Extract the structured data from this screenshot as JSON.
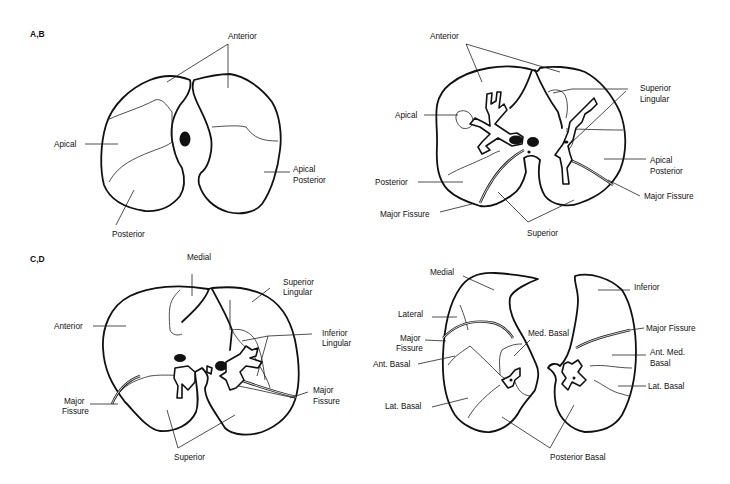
{
  "figure": {
    "panels": [
      {
        "id": "A,B",
        "left_section": {
          "labels": [
            "Anterior",
            "Apical",
            "Posterior",
            "Apical Posterior"
          ]
        },
        "right_section": {
          "labels": [
            "Anterior",
            "Apical",
            "Superior Lingular",
            "Apical Posterior",
            "Posterior",
            "Major Fissure",
            "Major Fissure",
            "Superior"
          ]
        }
      },
      {
        "id": "C,D",
        "left_section": {
          "labels": [
            "Medial",
            "Superior Lingular",
            "Anterior",
            "Inferior Lingular",
            "Major Fissure",
            "Major Fissure",
            "Superior"
          ]
        },
        "right_section": {
          "labels": [
            "Medial",
            "Inferior",
            "Lateral",
            "Major Fissure",
            "Major Fissure",
            "Med. Basal",
            "Ant. Med. Basal",
            "Ant. Basal",
            "Lat. Basal",
            "Lat. Basal",
            "Posterior Basal"
          ]
        }
      }
    ],
    "text": {
      "ab": "A,B",
      "cd": "C,D",
      "a_anterior": "Anterior",
      "a_apical": "Apical",
      "a_posterior": "Posterior",
      "a_apical_posterior_1": "Apical",
      "a_apical_posterior_2": "Posterior",
      "b_anterior": "Anterior",
      "b_apical": "Apical",
      "b_superior_lingular_1": "Superior",
      "b_superior_lingular_2": "Lingular",
      "b_apical_posterior_1": "Apical",
      "b_apical_posterior_2": "Posterior",
      "b_posterior": "Posterior",
      "b_major_fissure_left": "Major Fissure",
      "b_major_fissure_right": "Major Fissure",
      "b_superior": "Superior",
      "c_medial": "Medial",
      "c_superior_lingular_1": "Superior",
      "c_superior_lingular_2": "Lingular",
      "c_anterior": "Anterior",
      "c_inferior_lingular_1": "Inferior",
      "c_inferior_lingular_2": "Lingular",
      "c_major_fissure_left_1": "Major",
      "c_major_fissure_left_2": "Fissure",
      "c_major_fissure_right_1": "Major",
      "c_major_fissure_right_2": "Fissure",
      "c_superior": "Superior",
      "d_medial": "Medial",
      "d_inferior": "Inferior",
      "d_lateral": "Lateral",
      "d_major_fissure_left_1": "Major",
      "d_major_fissure_left_2": "Fissure",
      "d_major_fissure_right": "Major Fissure",
      "d_med_basal": "Med. Basal",
      "d_ant_med_basal_1": "Ant. Med.",
      "d_ant_med_basal_2": "Basal",
      "d_ant_basal": "Ant. Basal",
      "d_lat_basal_left": "Lat. Basal",
      "d_lat_basal_right": "Lat. Basal",
      "d_posterior_basal": "Posterior Basal"
    }
  }
}
